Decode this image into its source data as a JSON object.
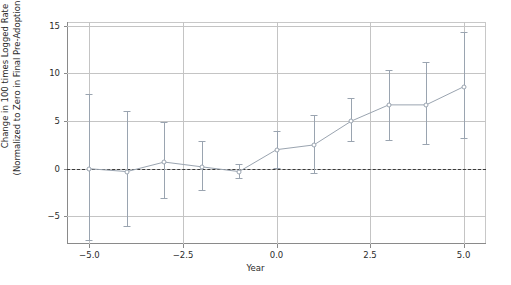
{
  "chart_data": {
    "type": "line",
    "title": "",
    "subtitle": "",
    "xlabel": "Year",
    "ylabel": "Change in 100 times Logged Rate\n(Normalized to Zero in Final Pre-Adoption Year)",
    "ylabel_line1": "Change in 100 times Logged Rate",
    "ylabel_line2": "(Normalized to Zero in Final Pre-Adoption Year)",
    "xlim": [
      -5.6,
      5.6
    ],
    "ylim": [
      -7.9,
      15.4
    ],
    "grid": true,
    "legend": false,
    "zero_reference_line": 0,
    "xticks": [
      -5.0,
      -2.5,
      0.0,
      2.5,
      5.0
    ],
    "xtick_labels": [
      "−5.0",
      "−2.5",
      "0.0",
      "2.5",
      "5.0"
    ],
    "yticks": [
      -5,
      0,
      5,
      10,
      15
    ],
    "ytick_labels": [
      "−5",
      "0",
      "5",
      "10",
      "15"
    ],
    "series": [
      {
        "name": "Change in 100 times Logged Rate",
        "marker": "open-circle",
        "color": "#9aa4b0",
        "x": [
          -5,
          -4,
          -3,
          -2,
          -1,
          0,
          1,
          2,
          3,
          4,
          5
        ],
        "values": [
          0.0,
          -0.3,
          0.7,
          0.2,
          -0.3,
          2.0,
          2.5,
          5.0,
          6.7,
          6.7,
          8.6
        ],
        "error_low": [
          -7.5,
          -6.0,
          -3.1,
          -2.2,
          -1.0,
          0.1,
          -0.4,
          2.9,
          3.0,
          2.6,
          3.2
        ],
        "error_high": [
          7.8,
          6.1,
          4.9,
          2.9,
          0.5,
          4.0,
          5.6,
          7.4,
          10.4,
          11.2,
          14.4
        ]
      }
    ]
  },
  "figure": {
    "background_color": "#ffffff",
    "grid_color": "#c4c4c4",
    "axis_color": "#8a8a8a",
    "text_color": "#2b2b2b",
    "series_color": "#9aa4b0",
    "zero_line_color": "#3a3a3a"
  }
}
